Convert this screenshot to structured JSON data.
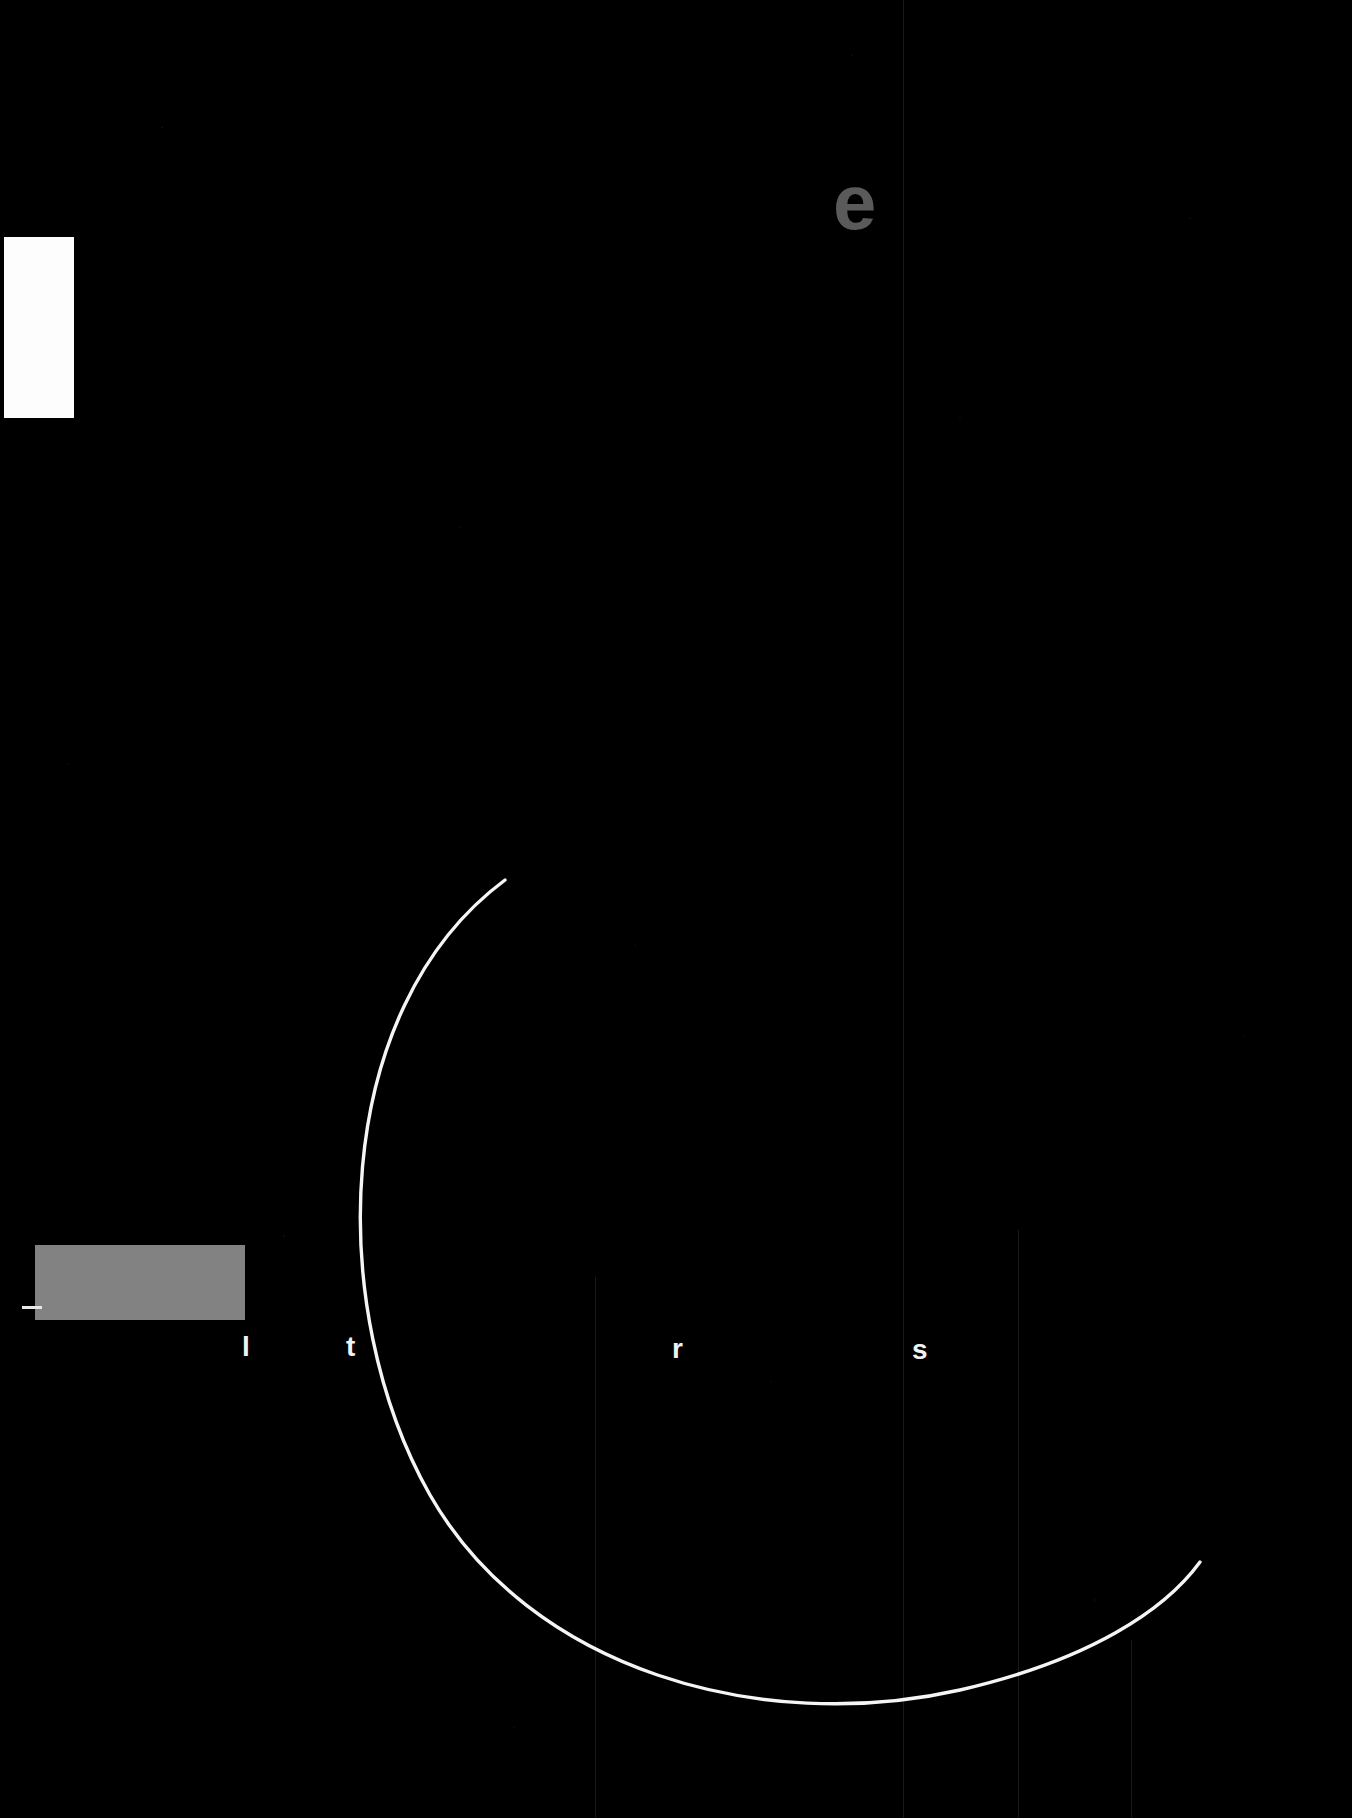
{
  "canvas": {
    "width": 1352,
    "height": 1818,
    "background_color": "#000000",
    "description": "Severely underexposed / near-black screenshot. Only a few high-luminance fragments remain visible."
  },
  "palette": {
    "background": "#000000",
    "white_block": "#fdfdfd",
    "gray_block": "#828282",
    "gray_glyph": "#5a5a5a",
    "white_glyph": "#f2f2f2",
    "arc_stroke": "#f5f5f5",
    "faint_rule": "#1a1a1a"
  },
  "shapes": {
    "white_panel": {
      "name": "white-rectangle",
      "x": 4,
      "y": 237,
      "width": 70,
      "height": 181,
      "color": "#fdfdfd"
    },
    "gray_bar": {
      "name": "gray-bar",
      "x": 35,
      "y": 1245,
      "width": 210,
      "height": 75,
      "color": "#828282"
    },
    "tick_mark": {
      "name": "left-tick-mark",
      "x": 22,
      "y": 1306,
      "width": 20,
      "height": 3,
      "color": "#e8e8e8"
    },
    "caret_bar": {
      "name": "caret-bar",
      "x": 242,
      "y": 1337,
      "width": 5,
      "height": 17,
      "color": "#f2f2f2"
    }
  },
  "arc": {
    "name": "large-white-arc",
    "stroke_color": "#f5f5f5",
    "stroke_width": 3.4,
    "path": "M 505 880 C 330 1010 325 1310 430 1495 C 530 1670 760 1735 960 1690 C 1090 1660 1165 1610 1200 1562",
    "endpoints": [
      [
        505,
        880
      ],
      [
        1200,
        1562
      ]
    ],
    "leftmost_point": [
      355,
      1235
    ],
    "lowest_point": [
      830,
      1700
    ]
  },
  "glyphs": [
    {
      "name": "glyph-e",
      "char": "e",
      "x": 833,
      "y": 163,
      "font_size": 78,
      "color": "#5a5a5a",
      "weight": "bold"
    },
    {
      "name": "glyph-l",
      "char": "l",
      "x": 242,
      "y": 1333,
      "font_size": 28,
      "color": "#f2f2f2",
      "weight": "bold"
    },
    {
      "name": "glyph-t",
      "char": "t",
      "x": 346,
      "y": 1333,
      "font_size": 28,
      "color": "#f2f2f2",
      "weight": "bold"
    },
    {
      "name": "glyph-r",
      "char": "r",
      "x": 672,
      "y": 1335,
      "font_size": 28,
      "color": "#f2f2f2",
      "weight": "bold"
    },
    {
      "name": "glyph-s",
      "char": "s",
      "x": 912,
      "y": 1336,
      "font_size": 28,
      "color": "#f2f2f2",
      "weight": "bold"
    }
  ],
  "faint_rules": [
    {
      "name": "faint-vertical-rule-1",
      "x": 903,
      "y": 0,
      "height": 1818
    },
    {
      "name": "faint-vertical-rule-2",
      "x": 595,
      "y": 1277,
      "height": 541
    },
    {
      "name": "faint-vertical-rule-3",
      "x": 1018,
      "y": 1230,
      "height": 588
    },
    {
      "name": "faint-vertical-rule-4",
      "x": 1131,
      "y": 1640,
      "height": 178
    }
  ]
}
